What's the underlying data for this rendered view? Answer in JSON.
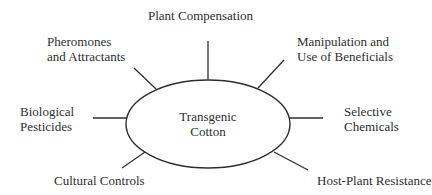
{
  "diagram": {
    "center": {
      "lines": [
        "Transgenic",
        "Cotton"
      ]
    },
    "nodes": [
      {
        "id": "plant-compensation",
        "lines": [
          "Plant Compensation"
        ]
      },
      {
        "id": "pheromones",
        "lines": [
          "Pheromones",
          "and Attractants"
        ]
      },
      {
        "id": "manipulation",
        "lines": [
          "Manipulation and",
          "Use of Beneficials"
        ]
      },
      {
        "id": "biological-pesticides",
        "lines": [
          "Biological",
          "Pesticides"
        ]
      },
      {
        "id": "selective-chemicals",
        "lines": [
          "Selective",
          "Chemicals"
        ]
      },
      {
        "id": "cultural-controls",
        "lines": [
          "Cultural Controls"
        ]
      },
      {
        "id": "host-plant-resistance",
        "lines": [
          "Host-Plant Resistance"
        ]
      }
    ],
    "stroke_color": "#2e2e2e",
    "background_color": "#ffffff"
  }
}
